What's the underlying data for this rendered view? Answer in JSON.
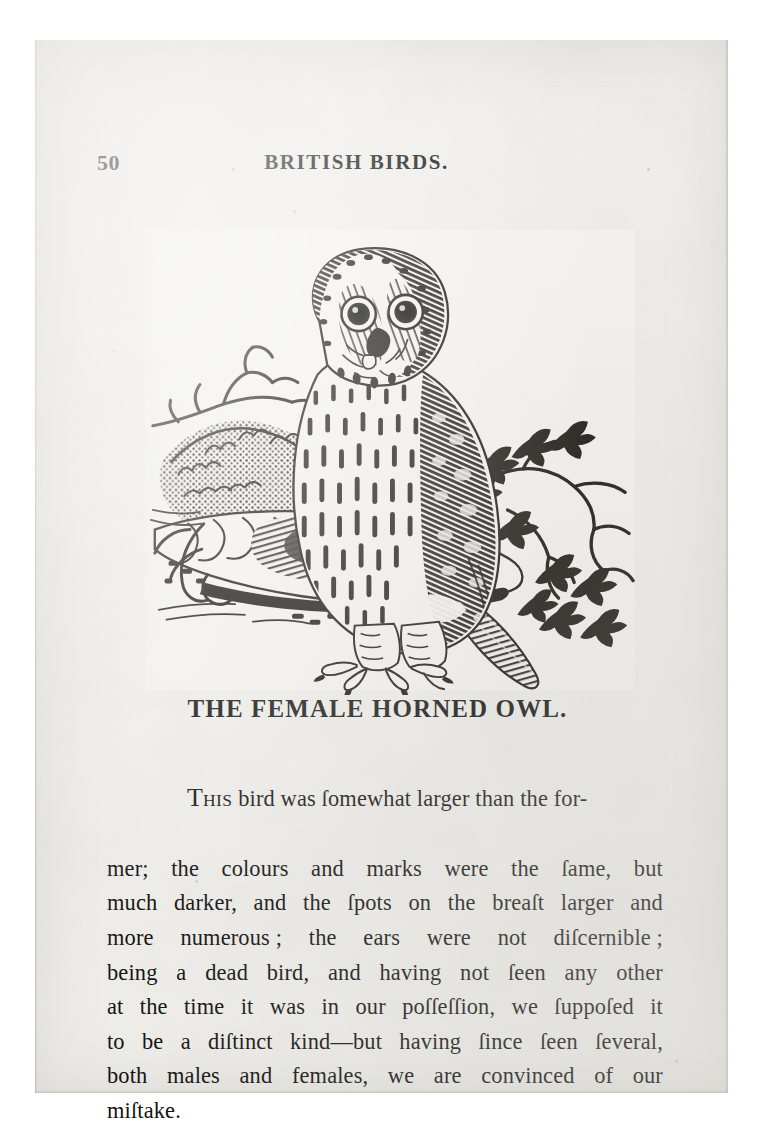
{
  "page": {
    "folio": "50",
    "running_head": "BRITISH BIRDS.",
    "heading": "THE FEMALE HORNED OWL.",
    "paper_color": "#f2f1ee",
    "ink_color": "#131211"
  },
  "illustration": {
    "name": "wood-engraving-horned-owl",
    "caption": "THE FEMALE HORNED OWL.",
    "subject": "owl perched on a mossy log with bare twigs at left and a leafy branch at right"
  },
  "body": {
    "lines": [
      {
        "segments": [
          "T",
          "HIS",
          " bird was ſomewhat larger than the for-"
        ],
        "indent": true,
        "smallcaps_index": 1
      },
      {
        "left": "mer;  the colours and marks were the ſame, but"
      },
      {
        "left": "much darker, and the ſpots on the breaſt larger and"
      },
      {
        "left": "more numerous ;  the ears were not diſcernible ;"
      },
      {
        "left": "being a dead bird, and having not ſeen any other"
      },
      {
        "left": "at the time it was in our poſſeſſion, we ſuppoſed it"
      },
      {
        "left": "to be a diſtinct kind—but having ſince ſeen ſeveral,"
      },
      {
        "left": "both males and females, we are convinced of our"
      },
      {
        "left": "miſtake."
      }
    ],
    "plain_text": "THIS bird was somewhat larger than the former; the colours and marks were the same, but much darker, and the spots on the breast larger and more numerous; the ears were not discernible; being a dead bird, and having not seen any other at the time it was in our possession, we supposed it to be a distinct kind—but having since seen several, both males and females, we are convinced of our mistake."
  }
}
